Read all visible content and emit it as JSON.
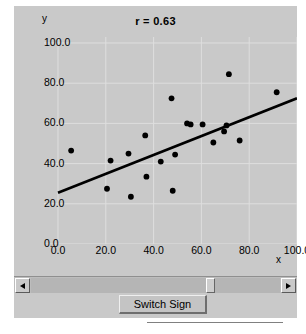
{
  "window": {
    "title": "r = 0.63"
  },
  "chart_data": {
    "type": "scatter",
    "title": "r = 0.63",
    "xlabel": "x",
    "ylabel": "y",
    "xlim": [
      0.0,
      100.0
    ],
    "ylim": [
      0.0,
      100.0
    ],
    "grid": true,
    "legend": null,
    "x_ticks": [
      "0.0",
      "20.0",
      "40.0",
      "60.0",
      "80.0",
      "100.0"
    ],
    "x_tick_values": [
      0,
      20,
      40,
      60,
      80,
      100
    ],
    "y_ticks": [
      "0.0",
      "20.0",
      "40.0",
      "60.0",
      "80.0",
      "100.0"
    ],
    "y_tick_values": [
      0,
      20,
      40,
      60,
      80,
      100
    ],
    "correlation": 0.63,
    "points": [
      {
        "x": 5.5,
        "y": 46.5
      },
      {
        "x": 20.5,
        "y": 27.5
      },
      {
        "x": 22.0,
        "y": 41.5
      },
      {
        "x": 29.5,
        "y": 45.0
      },
      {
        "x": 30.5,
        "y": 23.5
      },
      {
        "x": 36.5,
        "y": 54.0
      },
      {
        "x": 37.0,
        "y": 33.5
      },
      {
        "x": 43.0,
        "y": 41.0
      },
      {
        "x": 47.5,
        "y": 72.5
      },
      {
        "x": 48.0,
        "y": 26.5
      },
      {
        "x": 49.0,
        "y": 44.5
      },
      {
        "x": 54.0,
        "y": 60.0
      },
      {
        "x": 55.5,
        "y": 59.5
      },
      {
        "x": 60.5,
        "y": 59.5
      },
      {
        "x": 65.0,
        "y": 50.5
      },
      {
        "x": 69.5,
        "y": 56.0
      },
      {
        "x": 70.5,
        "y": 59.0
      },
      {
        "x": 71.5,
        "y": 84.5
      },
      {
        "x": 76.0,
        "y": 51.5
      },
      {
        "x": 91.5,
        "y": 75.5
      }
    ],
    "regression_line": {
      "x_start": 0.0,
      "y_start": 25.5,
      "x_end": 100.0,
      "y_end": 72.5
    }
  },
  "scrollbar": {
    "left_arrow_icon": "triangle-left-icon",
    "right_arrow_icon": "triangle-right-icon",
    "thumb_position_percent": 73
  },
  "controls": {
    "switch_sign_label": "Switch Sign"
  },
  "colors": {
    "panel_background": "#c9c9c9",
    "plot_background": "#c9c9c9",
    "gridline": "#dedede",
    "point": "#000000",
    "line": "#000000",
    "text": "#000000"
  }
}
